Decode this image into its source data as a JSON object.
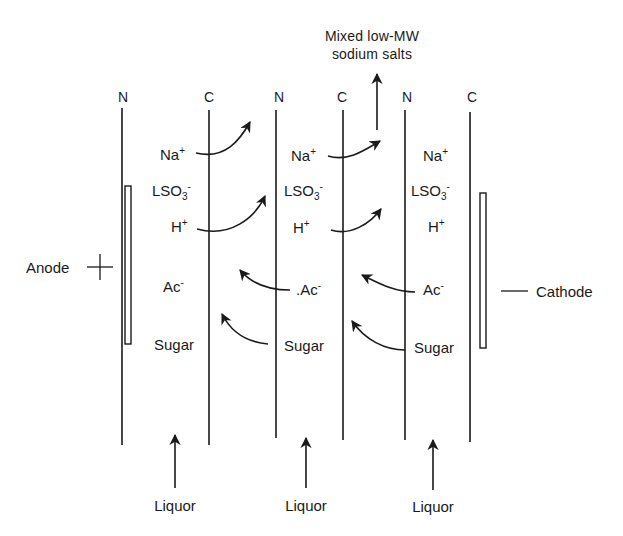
{
  "diagram": {
    "type": "electrodialysis membrane stack",
    "product": {
      "line1": "Mixed low-MW",
      "line2": "sodium salts"
    },
    "membranes": [
      {
        "label": "N"
      },
      {
        "label": "C"
      },
      {
        "label": "N"
      },
      {
        "label": "C"
      },
      {
        "label": "N"
      },
      {
        "label": "C"
      }
    ],
    "electrodes": {
      "anode": {
        "label": "Anode",
        "sign": "+"
      },
      "cathode": {
        "label": "Cathode",
        "sign": "—"
      }
    },
    "compartments": [
      {
        "species": {
          "na": {
            "base": "Na",
            "charge": "+"
          },
          "lso3": {
            "base": "LSO",
            "sub": "3",
            "charge": "-"
          },
          "h": {
            "base": "H",
            "charge": "+"
          },
          "ac": {
            "base": "Ac",
            "charge": "-"
          },
          "sugar": {
            "base": "Sugar"
          }
        },
        "feed": "Liquor"
      },
      {
        "species": {
          "na": {
            "base": "Na",
            "charge": "+"
          },
          "lso3": {
            "base": "LSO",
            "sub": "3",
            "charge": "-"
          },
          "h": {
            "base": "H",
            "charge": "+"
          },
          "ac": {
            "base": ".Ac",
            "charge": "-"
          },
          "sugar": {
            "base": "Sugar"
          }
        },
        "feed": "Liquor"
      },
      {
        "species": {
          "na": {
            "base": "Na",
            "charge": "+"
          },
          "lso3": {
            "base": "LSO",
            "sub": "3",
            "charge": "-"
          },
          "h": {
            "base": "H",
            "charge": "+"
          },
          "ac": {
            "base": "Ac",
            "charge": "-"
          },
          "sugar": {
            "base": "Sugar"
          }
        },
        "feed": "Liquor"
      }
    ],
    "flows": [
      {
        "species": "Na+",
        "from": "compartment-1",
        "direction": "right",
        "through": "C"
      },
      {
        "species": "H+",
        "from": "compartment-1",
        "direction": "right",
        "through": "C"
      },
      {
        "species": "Na+",
        "from": "compartment-2",
        "direction": "right",
        "through": "C"
      },
      {
        "species": "H+",
        "from": "compartment-2",
        "direction": "right",
        "through": "C"
      },
      {
        "species": "Ac-",
        "from": "compartment-2",
        "direction": "left",
        "through": "N"
      },
      {
        "species": "Sugar",
        "from": "compartment-2",
        "direction": "left",
        "through": "N"
      },
      {
        "species": "Ac-",
        "from": "compartment-3",
        "direction": "left",
        "through": "N"
      },
      {
        "species": "Sugar",
        "from": "compartment-3",
        "direction": "left",
        "through": "N"
      }
    ]
  }
}
